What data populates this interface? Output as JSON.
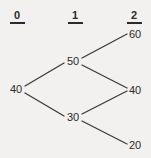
{
  "diagram": {
    "background_color": "#f2f1ef",
    "line_color": "#3a3a3a",
    "text_color": "#2b2b2b",
    "period_headers": [
      {
        "label": "0",
        "x": 17,
        "y": 9
      },
      {
        "label": "1",
        "x": 75,
        "y": 9
      },
      {
        "label": "2",
        "x": 134,
        "y": 9
      }
    ],
    "nodes": [
      {
        "id": "n0",
        "label": "40",
        "period": 0,
        "x": 16,
        "y": 89,
        "text_x": 10,
        "text_y": 84
      },
      {
        "id": "n1u",
        "label": "50",
        "period": 1,
        "x": 66,
        "y": 61,
        "text_x": 67,
        "text_y": 56
      },
      {
        "id": "n1d",
        "label": "30",
        "period": 1,
        "x": 66,
        "y": 117,
        "text_x": 67,
        "text_y": 112
      },
      {
        "id": "n2u",
        "label": "60",
        "period": 2,
        "x": 128,
        "y": 34,
        "text_x": 129,
        "text_y": 29
      },
      {
        "id": "n2m",
        "label": "40",
        "period": 2,
        "x": 128,
        "y": 90,
        "text_x": 129,
        "text_y": 85
      },
      {
        "id": "n2d",
        "label": "20",
        "period": 2,
        "x": 128,
        "y": 145,
        "text_x": 129,
        "text_y": 140
      }
    ],
    "edges": [
      {
        "from": "n0",
        "to": "n1u",
        "x1": 25,
        "y1": 86,
        "x2": 64,
        "y2": 63
      },
      {
        "from": "n0",
        "to": "n1d",
        "x1": 25,
        "y1": 93,
        "x2": 64,
        "y2": 116
      },
      {
        "from": "n1u",
        "to": "n2u",
        "x1": 82,
        "y1": 58,
        "x2": 127,
        "y2": 34
      },
      {
        "from": "n1u",
        "to": "n2m",
        "x1": 82,
        "y1": 65,
        "x2": 127,
        "y2": 88
      },
      {
        "from": "n1d",
        "to": "n2m",
        "x1": 82,
        "y1": 114,
        "x2": 127,
        "y2": 91
      },
      {
        "from": "n1d",
        "to": "n2d",
        "x1": 82,
        "y1": 121,
        "x2": 127,
        "y2": 144
      }
    ]
  }
}
